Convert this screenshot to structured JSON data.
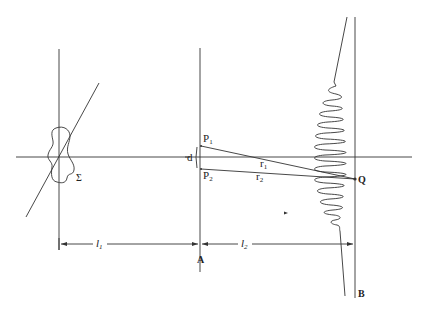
{
  "figure": {
    "labels": {
      "source": "Σ",
      "d": "d",
      "P1": "P",
      "P1_sub": "1",
      "P2": "P",
      "P2_sub": "2",
      "r1": "r",
      "r1_sub": "1",
      "r2": "r",
      "r2_sub": "2",
      "Q": "Q",
      "A": "A",
      "B": "B",
      "l1": "l",
      "l1_sub": "1",
      "l2": "l",
      "l2_sub": "2"
    },
    "colors": {
      "line": "#333333",
      "background": "#ffffff"
    }
  }
}
